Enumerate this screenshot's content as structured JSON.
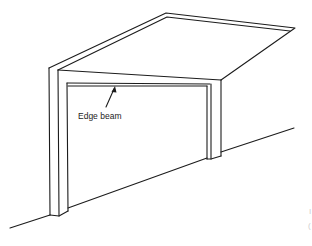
{
  "diagram": {
    "labels": {
      "edge_beam": "Edge beam"
    },
    "cropped_edge_text": [
      "I",
      "("
    ],
    "colors": {
      "line": "#1c1c1c",
      "background": "#ffffff"
    }
  }
}
